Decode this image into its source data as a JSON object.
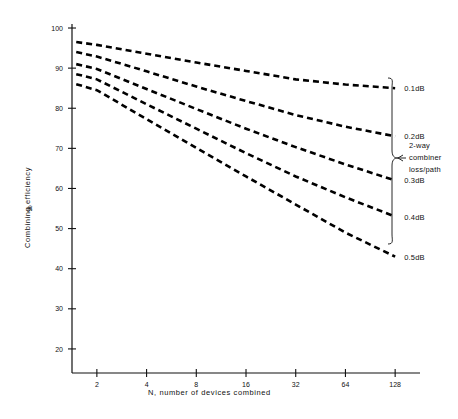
{
  "chart_data": {
    "type": "line",
    "title": "",
    "xlabel": "N,  number of devices combined",
    "ylabel": "Combining efficiency",
    "ylabel_units": "%",
    "xscale": "log2",
    "xlim": [
      1.414,
      181
    ],
    "ylim": [
      14,
      101
    ],
    "xticks": [
      2,
      4,
      8,
      16,
      32,
      64,
      128
    ],
    "xtick_labels": [
      "2",
      "4",
      "8",
      "16",
      "32",
      "64",
      "128"
    ],
    "yticks": [
      20,
      30,
      40,
      50,
      60,
      70,
      80,
      90,
      100
    ],
    "ytick_labels": [
      "20",
      "30",
      "40",
      "50",
      "60",
      "70",
      "80",
      "90",
      "100"
    ],
    "grid": false,
    "legend_position": "right",
    "legend_note": "2-way combiner loss/path",
    "legend_note_lines": [
      "2-way",
      "combiner",
      "loss/path"
    ],
    "line_style": "dashed",
    "line_color": "#000000",
    "x": [
      1.5,
      2,
      4,
      8,
      16,
      32,
      64,
      128
    ],
    "series": [
      {
        "name": "0.1dB",
        "label": "0.1dB",
        "values": [
          96.5,
          95.8,
          93.6,
          91.4,
          89.3,
          87.2,
          85.9,
          85.0
        ]
      },
      {
        "name": "0.2dB",
        "label": "0.2dB",
        "values": [
          94.0,
          92.9,
          89.2,
          85.4,
          81.8,
          78.3,
          75.4,
          73.0
        ]
      },
      {
        "name": "0.3dB",
        "label": "0.3dB",
        "values": [
          91.0,
          89.8,
          84.8,
          79.8,
          74.9,
          70.3,
          66.0,
          62.0
        ]
      },
      {
        "name": "0.4dB",
        "label": "0.4dB",
        "values": [
          88.5,
          87.2,
          81.0,
          74.9,
          68.8,
          63.0,
          57.8,
          53.0
        ]
      },
      {
        "name": "0.5dB",
        "label": "0.5dB",
        "values": [
          86.0,
          84.5,
          77.3,
          70.1,
          63.0,
          56.0,
          49.0,
          43.0
        ]
      }
    ]
  },
  "axes": {
    "x_title": "N,  number of devices combined",
    "y_title": "Combining efficiency",
    "y_units": "%"
  },
  "annotations": {
    "brace_line_1": "2-way",
    "brace_line_2": "combiner",
    "brace_line_3": "loss/path"
  }
}
